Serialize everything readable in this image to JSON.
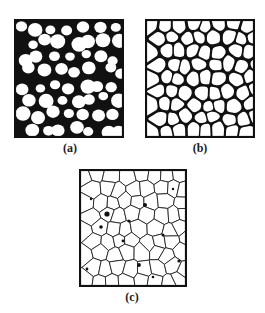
{
  "figure": {
    "background": "#ffffff",
    "ink_color": "#111111",
    "paper_color": "#ffffff",
    "panels": [
      {
        "id": "a",
        "label": "(a)",
        "description": "loose packing of rounded particles (circles) with large black pores",
        "box": {
          "x": 14,
          "y": 19,
          "w": 110,
          "h": 119
        },
        "label_pos": {
          "x": 70,
          "y": 142
        },
        "style": "circles"
      },
      {
        "id": "b",
        "label": "(b)",
        "description": "particles deformed and touching, faceted with smaller pores",
        "box": {
          "x": 145,
          "y": 19,
          "w": 110,
          "h": 119
        },
        "label_pos": {
          "x": 200,
          "y": 142
        },
        "style": "faceted"
      },
      {
        "id": "c",
        "label": "(c)",
        "description": "fully dense polyhedral grain structure with few isolated pores",
        "box": {
          "x": 79,
          "y": 169,
          "w": 108,
          "h": 118
        },
        "label_pos": {
          "x": 132,
          "y": 291
        },
        "style": "grains"
      }
    ]
  }
}
